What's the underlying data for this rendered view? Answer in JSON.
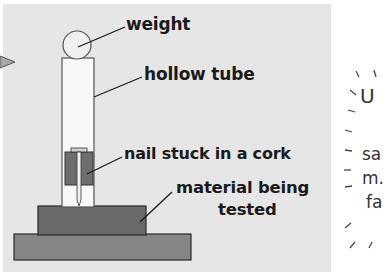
{
  "diagram": {
    "labels": {
      "weight": "weight",
      "tube": "hollow tube",
      "nail": "nail stuck in a cork",
      "material_line1": "material being",
      "material_line2": "tested"
    },
    "side_text": {
      "line1": "U",
      "line2": "sa",
      "line3": "m.",
      "line4": "fa"
    },
    "colors": {
      "panel": "#e6e6e6",
      "cork": "#6e6e6e",
      "material": "#6a6a6a",
      "base": "#858585",
      "outline": "#2a2a2a"
    }
  }
}
